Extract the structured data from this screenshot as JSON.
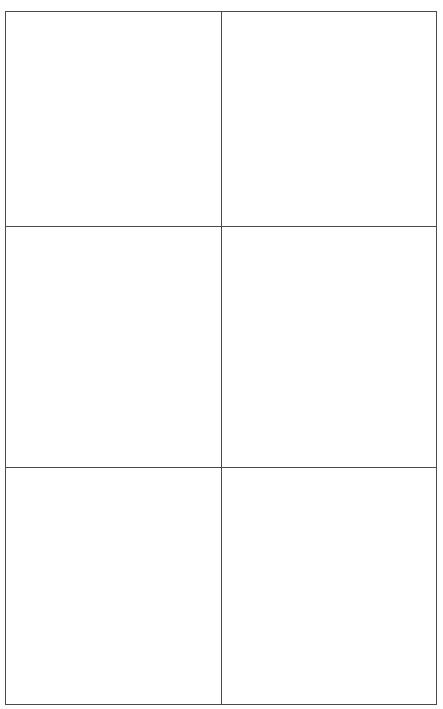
{
  "document": {
    "type": "blank-grid",
    "rows": 3,
    "columns": 2,
    "line_color": "#4a4a4a",
    "background_color": "#ffffff",
    "cells": [
      {
        "row": 0,
        "col": 0,
        "text": ""
      },
      {
        "row": 0,
        "col": 1,
        "text": ""
      },
      {
        "row": 1,
        "col": 0,
        "text": ""
      },
      {
        "row": 1,
        "col": 1,
        "text": ""
      },
      {
        "row": 2,
        "col": 0,
        "text": ""
      },
      {
        "row": 2,
        "col": 1,
        "text": ""
      }
    ]
  }
}
